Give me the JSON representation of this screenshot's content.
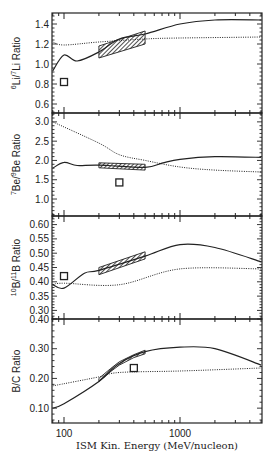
{
  "figure": {
    "xlabel": "ISM Kin. Energy (MeV/nucleon)",
    "x_tick_labels": [
      "100",
      "1000"
    ],
    "frame_color": "#222222"
  },
  "chart_data": [
    {
      "type": "line",
      "panel": "Li",
      "ylabel": "6Li/7Li Ratio",
      "ylabel_parts": {
        "sup1": "6",
        "base1": "Li/",
        "sup2": "7",
        "base2": "Li Ratio"
      },
      "xscale": "log",
      "xlim": [
        80,
        5000
      ],
      "ylim": [
        0.51,
        1.51
      ],
      "yticks": [
        0.6,
        0.8,
        1.0,
        1.2,
        1.4
      ],
      "ytick_labels": [
        "0.6",
        "0.8",
        "1.0",
        "1.2",
        "1.4"
      ],
      "series": [
        {
          "name": "solid",
          "style": "solid",
          "x": [
            80,
            100,
            130,
            200,
            300,
            500,
            1000,
            2000,
            5000
          ],
          "values": [
            0.93,
            1.09,
            1.03,
            1.12,
            1.25,
            1.3,
            1.4,
            1.44,
            1.44
          ]
        },
        {
          "name": "dotted",
          "style": "dotted",
          "x": [
            80,
            100,
            200,
            500,
            1000,
            5000
          ],
          "values": [
            1.22,
            1.19,
            1.22,
            1.25,
            1.26,
            1.27
          ]
        }
      ],
      "hatched_band": {
        "x": [
          200,
          500
        ],
        "lower": [
          1.06,
          1.2
        ],
        "upper": [
          1.18,
          1.33
        ]
      },
      "square_marker": {
        "x": 100,
        "y": 0.82
      }
    },
    {
      "type": "line",
      "panel": "Be",
      "ylabel": "7Be/9Be Ratio",
      "ylabel_parts": {
        "sup1": "7",
        "base1": "Be/",
        "sup2": "9",
        "base2": "Be Ratio"
      },
      "xscale": "log",
      "xlim": [
        80,
        5000
      ],
      "ylim": [
        0.56,
        3.23
      ],
      "yticks": [
        1.0,
        1.5,
        2.0,
        2.5,
        3.0
      ],
      "ytick_labels": [
        "1.0",
        "1.5",
        "2.0",
        "2.5",
        "3.0"
      ],
      "series": [
        {
          "name": "solid",
          "style": "solid",
          "x": [
            80,
            100,
            130,
            200,
            500,
            700,
            1000,
            2000,
            5000
          ],
          "values": [
            1.8,
            1.95,
            1.87,
            1.88,
            1.82,
            1.93,
            2.03,
            2.1,
            2.08
          ]
        },
        {
          "name": "dotted",
          "style": "dotted",
          "x": [
            80,
            200,
            300,
            500,
            1000,
            2000,
            5000
          ],
          "values": [
            3.0,
            2.45,
            2.15,
            2.0,
            1.83,
            1.75,
            1.7
          ]
        }
      ],
      "hatched_band": {
        "x": [
          200,
          500
        ],
        "lower": [
          1.81,
          1.75
        ],
        "upper": [
          1.94,
          1.9
        ]
      },
      "square_marker": {
        "x": 300,
        "y": 1.43
      }
    },
    {
      "type": "line",
      "panel": "B",
      "ylabel": "10B/11B Ratio",
      "ylabel_parts": {
        "sup1": "10",
        "base1": "B/",
        "sup2": "11",
        "base2": "B Ratio"
      },
      "xscale": "log",
      "xlim": [
        80,
        5000
      ],
      "ylim": [
        0.27,
        0.63
      ],
      "yticks": [
        0.3,
        0.35,
        0.4,
        0.45,
        0.5,
        0.55,
        0.6
      ],
      "ytick_labels": [
        "0.30",
        "0.35",
        "0.40",
        "0.45",
        "0.50",
        "0.55",
        "0.60"
      ],
      "series": [
        {
          "name": "solid",
          "style": "solid",
          "x": [
            80,
            100,
            150,
            200,
            500,
            1000,
            2000,
            5000
          ],
          "values": [
            0.39,
            0.378,
            0.43,
            0.44,
            0.49,
            0.53,
            0.52,
            0.47
          ]
        },
        {
          "name": "dotted",
          "style": "dotted",
          "x": [
            80,
            100,
            300,
            1000,
            5000
          ],
          "values": [
            0.39,
            0.395,
            0.39,
            0.445,
            0.445
          ]
        }
      ],
      "hatched_band": {
        "x": [
          200,
          500
        ],
        "lower": [
          0.425,
          0.48
        ],
        "upper": [
          0.45,
          0.505
        ]
      },
      "square_marker": {
        "x": 100,
        "y": 0.42
      }
    },
    {
      "type": "line",
      "panel": "B/C",
      "ylabel": "B/C Ratio",
      "ylabel_parts": {
        "sup1": "",
        "base1": "B/C Ratio",
        "sup2": "",
        "base2": ""
      },
      "xscale": "log",
      "xlim": [
        80,
        5000
      ],
      "ylim": [
        0.05,
        0.4
      ],
      "yticks": [
        0.1,
        0.2,
        0.3,
        0.4
      ],
      "ytick_labels": [
        "0.10",
        "0.20",
        "0.30",
        "0.40"
      ],
      "series": [
        {
          "name": "solid",
          "style": "solid",
          "x": [
            80,
            100,
            200,
            300,
            500,
            1000,
            2000,
            5000
          ],
          "values": [
            0.1,
            0.115,
            0.19,
            0.25,
            0.29,
            0.305,
            0.3,
            0.245
          ]
        },
        {
          "name": "dotted",
          "style": "dotted",
          "x": [
            80,
            200,
            300,
            1000,
            5000
          ],
          "values": [
            0.175,
            0.205,
            0.22,
            0.225,
            0.235
          ]
        }
      ],
      "hatched_band": {
        "x": [
          200,
          250,
          300,
          400,
          500
        ],
        "lower": [
          0.19,
          0.222,
          0.245,
          0.27,
          0.283
        ],
        "upper": [
          0.2,
          0.232,
          0.256,
          0.28,
          0.295
        ]
      },
      "square_marker": {
        "x": 400,
        "y": 0.235
      }
    }
  ]
}
